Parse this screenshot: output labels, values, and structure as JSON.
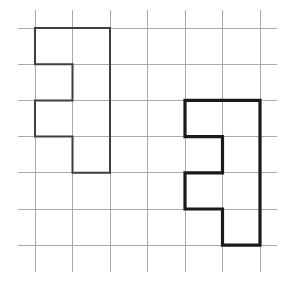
{
  "figure": {
    "caption_fragment": ")",
    "background_color": "#ffffff",
    "width": 286,
    "height": 286
  },
  "grid": {
    "name": "square-lattice",
    "line_color": "#a9a9a9",
    "line_width": 1,
    "vertical_x": [
      35,
      72.5,
      110,
      147.5,
      185,
      222.5,
      260
    ],
    "horizontal_y": [
      28,
      64.2,
      100.4,
      136.6,
      172.8,
      209,
      245.2
    ],
    "vertical_extent": [
      10,
      272
    ],
    "horizontal_extent": [
      18,
      277
    ],
    "columns": 7,
    "rows": 7,
    "cell_width": 37.5,
    "cell_height": 36.2
  },
  "shapes": [
    {
      "name": "left-polygon",
      "label": "left-hexomino-outline",
      "stroke_color": "#3f3f3f",
      "stroke_width": 2,
      "fill": "none",
      "grid_cells": [
        [
          0,
          0
        ],
        [
          1,
          0
        ],
        [
          1,
          1
        ],
        [
          0,
          2
        ],
        [
          1,
          2
        ],
        [
          1,
          3
        ]
      ],
      "points": [
        [
          35,
          28
        ],
        [
          110,
          28
        ],
        [
          110,
          172.8
        ],
        [
          72.5,
          172.8
        ],
        [
          72.5,
          136.6
        ],
        [
          35,
          136.6
        ],
        [
          35,
          100.4
        ],
        [
          72.5,
          100.4
        ],
        [
          72.5,
          64.2
        ],
        [
          35,
          64.2
        ],
        [
          35,
          28
        ]
      ]
    },
    {
      "name": "right-polygon",
      "label": "right-hexomino-outline",
      "stroke_color": "#1a1a1a",
      "stroke_width": 3.2,
      "fill": "none",
      "grid_cells": [
        [
          4,
          2
        ],
        [
          5,
          2
        ],
        [
          5,
          3
        ],
        [
          4,
          4
        ],
        [
          5,
          4
        ],
        [
          5,
          5
        ]
      ],
      "points": [
        [
          185,
          100.4
        ],
        [
          260,
          100.4
        ],
        [
          260,
          245.2
        ],
        [
          222.5,
          245.2
        ],
        [
          222.5,
          209
        ],
        [
          185,
          209
        ],
        [
          185,
          172.8
        ],
        [
          222.5,
          172.8
        ],
        [
          222.5,
          136.6
        ],
        [
          185,
          136.6
        ],
        [
          185,
          100.4
        ]
      ]
    }
  ]
}
